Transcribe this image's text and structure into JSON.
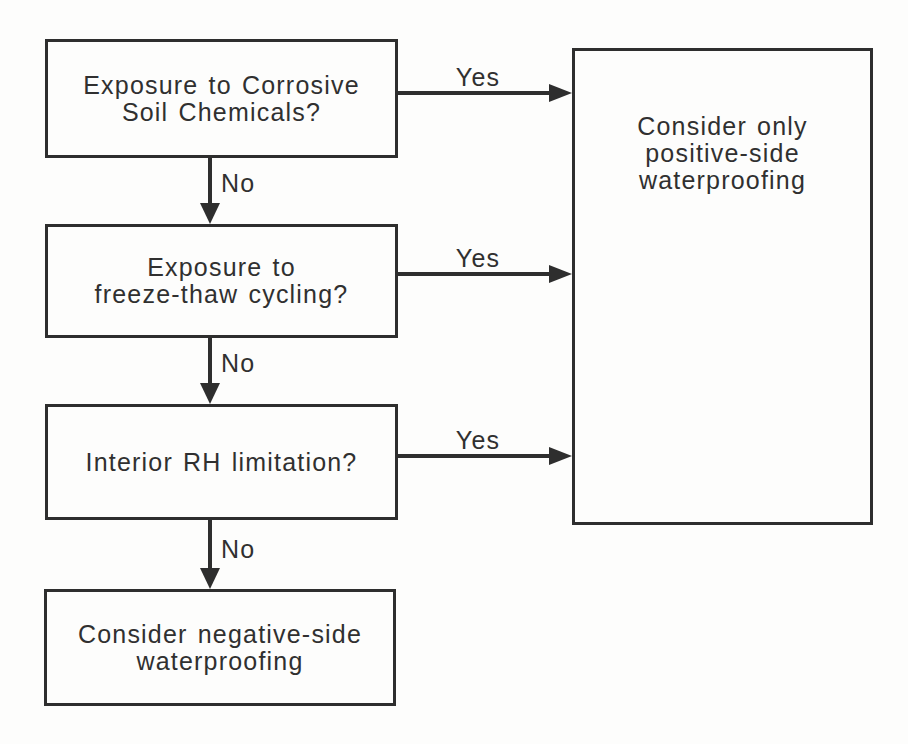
{
  "diagram": {
    "type": "flowchart",
    "colors": {
      "ink": "#2e2e2e",
      "paper": "#fdfdfc",
      "text": "#303030"
    },
    "nodes": [
      {
        "id": "q-corrosive-soil",
        "lines": [
          "Exposure to Corrosive",
          "Soil Chemicals?"
        ]
      },
      {
        "id": "q-freeze-thaw",
        "lines": [
          "Exposure to",
          "freeze-thaw cycling?"
        ]
      },
      {
        "id": "q-interior-rh",
        "lines": [
          "Interior RH limitation?"
        ]
      },
      {
        "id": "outcome-negative-side",
        "lines": [
          "Consider negative-side",
          "waterproofing"
        ]
      },
      {
        "id": "outcome-positive-side",
        "lines": [
          "Consider only",
          "positive-side",
          "waterproofing"
        ]
      }
    ],
    "edges": [
      {
        "from": "q-corrosive-soil",
        "to": "outcome-positive-side",
        "label": "Yes"
      },
      {
        "from": "q-corrosive-soil",
        "to": "q-freeze-thaw",
        "label": "No"
      },
      {
        "from": "q-freeze-thaw",
        "to": "outcome-positive-side",
        "label": "Yes"
      },
      {
        "from": "q-freeze-thaw",
        "to": "q-interior-rh",
        "label": "No"
      },
      {
        "from": "q-interior-rh",
        "to": "outcome-positive-side",
        "label": "Yes"
      },
      {
        "from": "q-interior-rh",
        "to": "outcome-negative-side",
        "label": "No"
      }
    ]
  }
}
